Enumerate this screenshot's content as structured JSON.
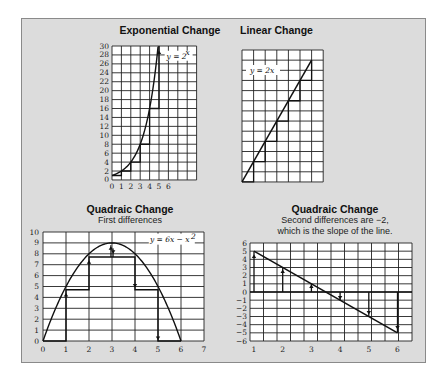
{
  "panel": {
    "background": "#dcdcdc",
    "border": "#8a8a8a"
  },
  "chart_data": [
    {
      "type": "line",
      "title": "Exponential Change",
      "equation_label": "y = 2^x",
      "x_ticks": [
        "0",
        "1",
        "2",
        "3",
        "4",
        "5",
        "6"
      ],
      "y_ticks": [
        "0",
        "2",
        "4",
        "6",
        "8",
        "10",
        "12",
        "14",
        "16",
        "18",
        "20",
        "22",
        "24",
        "26",
        "28",
        "30"
      ],
      "xlim": [
        0,
        9
      ],
      "ylim": [
        0,
        30
      ],
      "x": [
        0,
        1,
        2,
        3,
        4,
        5
      ],
      "y": [
        1,
        2,
        4,
        8,
        16,
        32
      ],
      "step_differences": [
        1,
        2,
        4,
        8,
        16
      ],
      "grid": true
    },
    {
      "type": "line",
      "title": "Linear Change",
      "equation_label": "y = 2x",
      "xlim": [
        0,
        7
      ],
      "ylim": [
        0,
        13
      ],
      "x": [
        0,
        1,
        2,
        3,
        4,
        5,
        6
      ],
      "y": [
        0,
        2,
        4,
        6,
        8,
        10,
        12
      ],
      "step_differences": [
        2,
        2,
        2,
        2,
        2,
        2
      ],
      "grid": true
    },
    {
      "type": "line",
      "title": "Quadraic Change",
      "subtitle": "First differences",
      "equation_label": "y = 6x − x²",
      "x_ticks": [
        "0",
        "1",
        "2",
        "3",
        "4",
        "5",
        "6",
        "7"
      ],
      "y_ticks": [
        "0",
        "1",
        "2",
        "3",
        "4",
        "5",
        "6",
        "7",
        "8",
        "9",
        "10"
      ],
      "xlim": [
        0,
        7
      ],
      "ylim": [
        0,
        10
      ],
      "x": [
        0,
        1,
        2,
        3,
        4,
        5,
        6
      ],
      "y": [
        0,
        5,
        8,
        9,
        8,
        5,
        0
      ],
      "first_differences": [
        5,
        3,
        1,
        -1,
        -3,
        -5
      ],
      "grid": true
    },
    {
      "type": "line",
      "title": "Quadraic Change",
      "subtitle": "Second differences are −2,\nwhich is the slope of the line.",
      "x_ticks": [
        "1",
        "2",
        "3",
        "4",
        "5",
        "6"
      ],
      "y_ticks": [
        "6",
        "5",
        "4",
        "3",
        "2",
        "1",
        "0",
        "−1",
        "−2",
        "−3",
        "−4",
        "−5",
        "−6"
      ],
      "xlim": [
        0.6,
        6.6
      ],
      "ylim": [
        -6,
        6
      ],
      "x": [
        1,
        2,
        3,
        4,
        5,
        6
      ],
      "y": [
        5,
        3,
        1,
        -1,
        -3,
        -5
      ],
      "grid": true
    }
  ],
  "labels": {
    "exp_title": "Exponential Change",
    "lin_title": "Linear Change",
    "quad1_title": "Quadraic Change",
    "quad1_sub": "First differences",
    "quad2_title": "Quadraic Change",
    "quad2_sub1": "Second differences are −2,",
    "quad2_sub2": "which is the slope of the line."
  }
}
